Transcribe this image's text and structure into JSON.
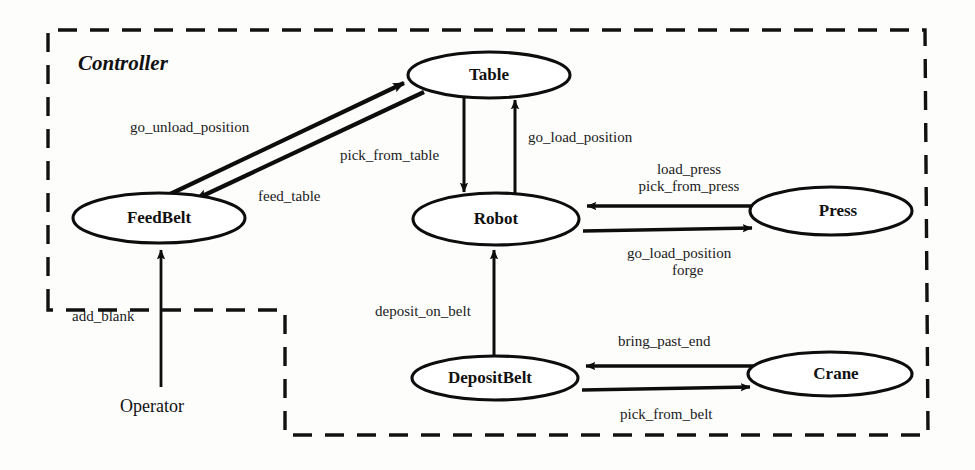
{
  "diagram": {
    "type": "component-interaction-diagram",
    "boundary": {
      "label": "Controller",
      "style": "dashed",
      "color": "#111111"
    },
    "nodes": [
      {
        "id": "table",
        "label": "Table",
        "cx": 489,
        "cy": 75,
        "rx": 81,
        "ry": 23
      },
      {
        "id": "feedbelt",
        "label": "FeedBelt",
        "cx": 159,
        "cy": 218,
        "rx": 86,
        "ry": 25
      },
      {
        "id": "robot",
        "label": "Robot",
        "cx": 496,
        "cy": 219,
        "rx": 83,
        "ry": 26
      },
      {
        "id": "press",
        "label": "Press",
        "cx": 831,
        "cy": 211,
        "rx": 81,
        "ry": 24
      },
      {
        "id": "depositbelt",
        "label": "DepositBelt",
        "cx": 495,
        "cy": 378,
        "rx": 83,
        "ry": 22
      },
      {
        "id": "crane",
        "label": "Crane",
        "cx": 830,
        "cy": 374,
        "rx": 82,
        "ry": 22
      }
    ],
    "actors": [
      {
        "id": "operator",
        "label": "Operator",
        "x": 152,
        "y": 405
      }
    ],
    "edges": [
      {
        "id": "go-unload-position",
        "label": "go_unload_position",
        "from": "feedbelt",
        "to": "table",
        "lx": 130,
        "ly": 132
      },
      {
        "id": "feed-table",
        "label": "feed_table",
        "from": "table",
        "to": "feedbelt",
        "lx": 258,
        "ly": 201
      },
      {
        "id": "pick-from-table",
        "label": "pick_from_table",
        "from": "table",
        "to": "robot",
        "lx": 340,
        "ly": 160
      },
      {
        "id": "go-load-position",
        "label": "go_load_position",
        "from": "robot",
        "to": "table",
        "lx": 528,
        "ly": 142
      },
      {
        "id": "load-press",
        "label": "load_press",
        "from": "press",
        "to": "robot",
        "lx": 689,
        "ly": 174
      },
      {
        "id": "pick-from-press",
        "label": "pick_from_press",
        "from": "press",
        "to": "robot",
        "lx": 664,
        "ly": 190
      },
      {
        "id": "go-load-position-2",
        "label": "go_load_position",
        "from": "robot",
        "to": "press",
        "lx": 627,
        "ly": 257
      },
      {
        "id": "forge",
        "label": "forge",
        "from": "robot",
        "to": "press",
        "lx": 672,
        "ly": 274
      },
      {
        "id": "deposit-on-belt",
        "label": "deposit_on_belt",
        "from": "robot",
        "to": "depositbelt",
        "lx": 375,
        "ly": 315
      },
      {
        "id": "bring-past-end",
        "label": "bring_past_end",
        "from": "crane",
        "to": "depositbelt",
        "lx": 618,
        "ly": 345
      },
      {
        "id": "pick-from-belt",
        "label": "pick_from_belt",
        "from": "depositbelt",
        "to": "crane",
        "lx": 620,
        "ly": 418
      },
      {
        "id": "add-blank",
        "label": "add_blank",
        "from": "operator",
        "to": "feedbelt",
        "lx": 72,
        "ly": 320
      }
    ]
  }
}
